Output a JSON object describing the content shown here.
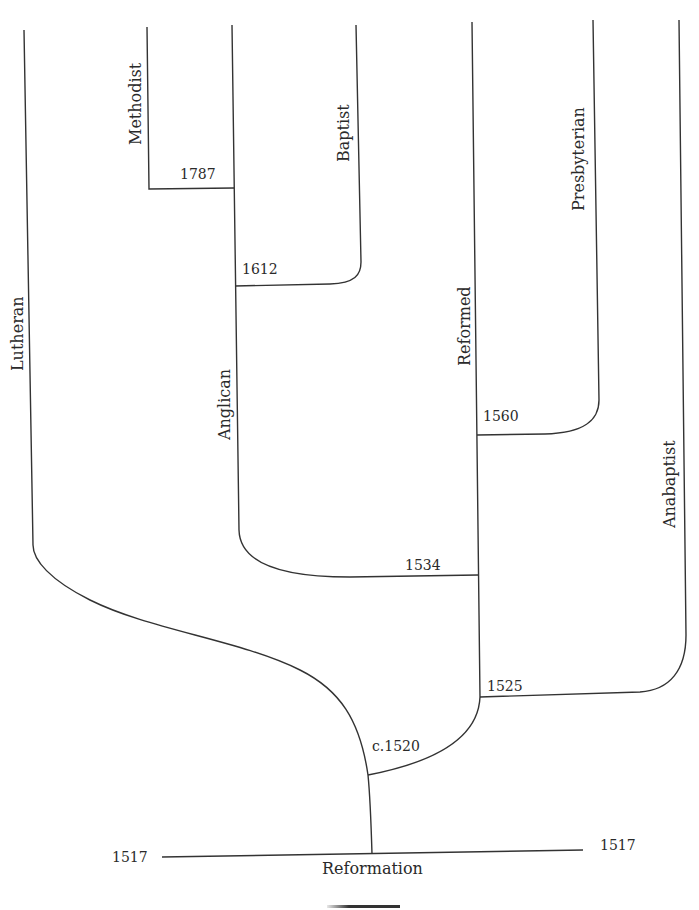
{
  "diagram": {
    "type": "denomination-tree",
    "root": {
      "label": "Reformation",
      "year_left": "1517",
      "year_right": "1517"
    },
    "branches": [
      {
        "name": "Lutheran"
      },
      {
        "name": "Methodist"
      },
      {
        "name": "Anglican"
      },
      {
        "name": "Baptist"
      },
      {
        "name": "Reformed"
      },
      {
        "name": "Presbyterian"
      },
      {
        "name": "Anabaptist"
      }
    ],
    "splits": [
      {
        "year": "c.1520",
        "from": "Reformation",
        "to": [
          "Lutheran",
          "Reformed"
        ]
      },
      {
        "year": "1525",
        "from": "Reformed",
        "to": [
          "Anabaptist"
        ]
      },
      {
        "year": "1534",
        "from": "Reformed",
        "to": [
          "Anglican"
        ]
      },
      {
        "year": "1560",
        "from": "Reformed",
        "to": [
          "Presbyterian"
        ]
      },
      {
        "year": "1612",
        "from": "Anglican",
        "to": [
          "Baptist"
        ]
      },
      {
        "year": "1787",
        "from": "Anglican",
        "to": [
          "Methodist"
        ]
      }
    ]
  },
  "colors": {
    "line": "#333333",
    "text": "#2a2a2a",
    "background": "#ffffff"
  }
}
